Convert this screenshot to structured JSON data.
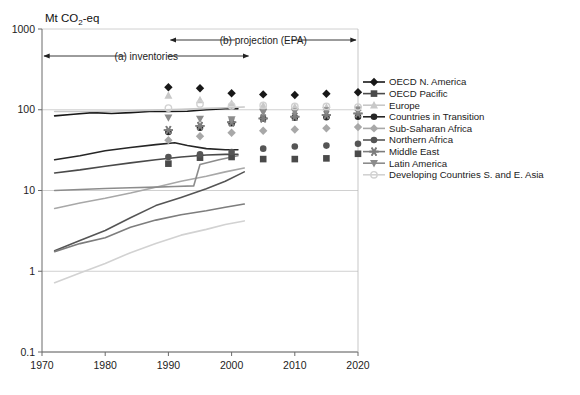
{
  "chart_data": {
    "type": "line",
    "title": "Mt CO2-eq",
    "title_parts": {
      "prefix": "Mt CO",
      "sub": "2",
      "suffix": "-eq"
    },
    "xlabel": "",
    "ylabel": "",
    "yscale": "log",
    "ylim": [
      0.1,
      1000
    ],
    "xlim": [
      1970,
      2020
    ],
    "ytick_labels": [
      "1000",
      "100",
      "10",
      "1",
      "0.1"
    ],
    "ytick_values": [
      1000,
      100,
      10,
      1,
      0.1
    ],
    "xtick_labels": [
      "1970",
      "1980",
      "1990",
      "2000",
      "2010",
      "2020"
    ],
    "xtick_values": [
      1970,
      1980,
      1990,
      2000,
      2010,
      2020
    ],
    "grid": "horizontal-only",
    "legend_position": "right-outside",
    "annotations": [
      {
        "id": "inventories",
        "text": "(a) inventories",
        "x_start": 1970,
        "x_end": 2003,
        "arrow": "double"
      },
      {
        "id": "projection",
        "text": "(b) projection (EPA)",
        "x_start": 1990,
        "x_end": 2020,
        "arrow": "double"
      }
    ],
    "marker_years": [
      1990,
      1995,
      2000,
      2005,
      2010,
      2015,
      2020
    ],
    "series": [
      {
        "name": "OECD N. America",
        "color": "#181818",
        "marker": "diamond",
        "line_x": [
          1972,
          1975,
          1978,
          1981,
          1984,
          1987,
          1990,
          1993,
          1996,
          1999,
          2001
        ],
        "line_y": [
          84,
          88,
          92,
          90,
          92,
          95,
          95,
          96,
          100,
          103,
          103
        ],
        "marker_x": [
          1990,
          1995,
          2000,
          2005,
          2010,
          2015,
          2020
        ],
        "marker_y": [
          190,
          185,
          160,
          155,
          152,
          158,
          165
        ]
      },
      {
        "name": "OECD Pacific",
        "color": "#4a4a4a",
        "marker": "square",
        "line_x": [
          1972,
          1976,
          1980,
          1984,
          1988,
          1992,
          1996,
          1999,
          2001
        ],
        "line_y": [
          16.5,
          18,
          20,
          22,
          24,
          26,
          27.5,
          28,
          28
        ],
        "marker_x": [
          1990,
          1995,
          2000,
          2005,
          2010,
          2015,
          2020
        ],
        "marker_y": [
          21.5,
          25.5,
          26,
          24.5,
          24.5,
          25,
          28.5
        ]
      },
      {
        "name": "Europe",
        "color": "#c8c8c8",
        "marker": "triangle-up",
        "line_x": [
          1972,
          1976,
          1980,
          1984,
          1988,
          1992,
          1996,
          1999,
          2002
        ],
        "line_y": [
          95,
          95,
          96,
          97,
          99,
          101,
          104,
          106,
          108
        ],
        "marker_x": [
          1990,
          1995,
          2000,
          2005,
          2010,
          2015,
          2020
        ],
        "marker_y": [
          150,
          132,
          120,
          112,
          108,
          107,
          106
        ]
      },
      {
        "name": "Countries in Transition",
        "color": "#262626",
        "marker": "circle",
        "line_x": [
          1972,
          1976,
          1980,
          1984,
          1988,
          1991,
          1993,
          1996,
          1999,
          2001
        ],
        "line_y": [
          24,
          27,
          31,
          34,
          37,
          39,
          36,
          33,
          32,
          32
        ],
        "marker_x": [
          1990,
          1995,
          2000,
          2005,
          2010,
          2015,
          2020
        ],
        "marker_y": [
          53,
          60,
          68,
          78,
          80,
          81,
          82
        ]
      },
      {
        "name": "Sub-Saharan Africa",
        "color": "#a8a8a8",
        "marker": "diamond",
        "line_x": [
          1972,
          1976,
          1980,
          1984,
          1988,
          1992,
          1996,
          1999,
          2002
        ],
        "line_y": [
          6.0,
          7.0,
          8.0,
          9.3,
          11,
          13,
          15,
          17,
          19
        ],
        "marker_x": [
          1990,
          1995,
          2000,
          2005,
          2010,
          2015,
          2020
        ],
        "marker_y": [
          42,
          47,
          52,
          55,
          57,
          59,
          61
        ]
      },
      {
        "name": "Northern Africa",
        "color": "#555555",
        "marker": "circle",
        "line_x": [
          1972,
          1976,
          1980,
          1984,
          1988,
          1992,
          1996,
          1999,
          2002
        ],
        "line_y": [
          1.8,
          2.4,
          3.2,
          4.6,
          6.5,
          8.2,
          10.5,
          13,
          17
        ],
        "marker_x": [
          1990,
          1995,
          2000,
          2005,
          2010,
          2015,
          2020
        ],
        "marker_y": [
          26,
          28,
          30,
          33,
          35,
          36,
          38
        ]
      },
      {
        "name": "Middle East",
        "color": "#7d7d7d",
        "marker": "asterisk",
        "line_x": [
          1972,
          1976,
          1980,
          1984,
          1988,
          1992,
          1996,
          1999,
          2002
        ],
        "line_y": [
          1.75,
          2.2,
          2.6,
          3.5,
          4.3,
          5.0,
          5.6,
          6.2,
          6.8
        ],
        "marker_x": [
          1990,
          1995,
          2000,
          2005,
          2010,
          2015,
          2020
        ],
        "marker_y": [
          56,
          63,
          70,
          78,
          82,
          86,
          90
        ]
      },
      {
        "name": "Latin America",
        "color": "#8c8c8c",
        "marker": "triangle-down",
        "line_x": [
          1972,
          1976,
          1980,
          1984,
          1988,
          1991,
          1994,
          1995,
          1998,
          2001
        ],
        "line_y": [
          10.0,
          10.3,
          10.6,
          10.8,
          11,
          11.2,
          11.4,
          21,
          24,
          27
        ],
        "marker_x": [
          1990,
          1995,
          2000,
          2005,
          2010,
          2015,
          2020
        ],
        "marker_y": [
          80,
          77,
          76,
          93,
          95,
          98,
          100
        ]
      },
      {
        "name": "Developing Countries S. and E. Asia",
        "color": "#d2d2d2",
        "marker": "circle-open",
        "line_x": [
          1972,
          1976,
          1980,
          1984,
          1988,
          1992,
          1996,
          1999,
          2002
        ],
        "line_y": [
          0.72,
          0.95,
          1.25,
          1.7,
          2.2,
          2.8,
          3.3,
          3.8,
          4.2
        ],
        "marker_x": [
          1990,
          1995,
          2000,
          2005,
          2010,
          2015,
          2020
        ],
        "marker_y": [
          105,
          118,
          112,
          113,
          110,
          110,
          108
        ]
      }
    ]
  },
  "legend": {
    "items": [
      {
        "label": "OECD N. America",
        "icon": "diamond-marker-icon"
      },
      {
        "label": "OECD Pacific",
        "icon": "square-marker-icon"
      },
      {
        "label": "Europe",
        "icon": "triangle-up-marker-icon"
      },
      {
        "label": "Countries in Transition",
        "icon": "circle-marker-icon"
      },
      {
        "label": "Sub-Saharan Africa",
        "icon": "diamond-marker-icon"
      },
      {
        "label": "Northern Africa",
        "icon": "circle-marker-icon"
      },
      {
        "label": "Middle East",
        "icon": "asterisk-marker-icon"
      },
      {
        "label": "Latin America",
        "icon": "triangle-down-marker-icon"
      },
      {
        "label": "Developing Countries S. and E. Asia",
        "icon": "circle-open-marker-icon"
      }
    ]
  }
}
